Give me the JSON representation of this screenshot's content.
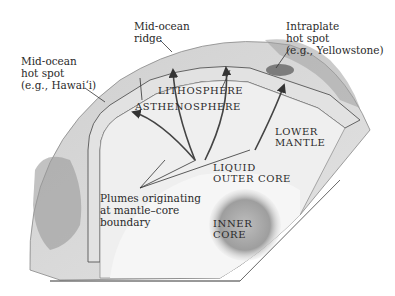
{
  "diagram": {
    "callouts": {
      "mid_ocean_hot_spot": [
        "Mid-ocean",
        "hot spot",
        "(e.g., Hawai‘i)"
      ],
      "mid_ocean_ridge": [
        "Mid-ocean",
        "ridge"
      ],
      "intraplate_hot_spot": [
        "Intraplate",
        "hot spot",
        "(e.g., Yellowstone)"
      ],
      "plumes": [
        "Plumes originating",
        "at mantle–core",
        "boundary"
      ]
    },
    "layers": {
      "lithosphere": "LITHOSPHERE",
      "asthenosphere": "ASTHENOSPHERE",
      "lower_mantle": [
        "LOWER",
        "MANTLE"
      ],
      "outer_core": [
        "LIQUID",
        "OUTER CORE"
      ],
      "inner_core": [
        "INNER",
        "CORE"
      ]
    },
    "colors": {
      "background": "#ffffff",
      "crust": "#d9d9d9",
      "mantle": "#ececec",
      "outer_core": "#f3f3f3",
      "inner_core": "#9a9a9a",
      "line": "#333333",
      "text": "#2a2a2a"
    }
  }
}
